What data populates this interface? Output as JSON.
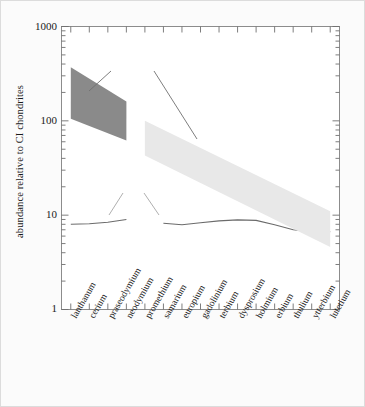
{
  "chart_data": {
    "type": "area",
    "title": "",
    "xlabel": "",
    "ylabel": "abundance relative to CI chondrites",
    "yscale": "log",
    "ylim": [
      1,
      1000
    ],
    "ytick_labels": [
      "1000",
      "100",
      "10",
      "1"
    ],
    "ytick_values": [
      1000,
      100,
      10,
      1
    ],
    "grid": false,
    "legend_position": "inline-annotations",
    "categories": [
      "lanthanum",
      "cerium",
      "praseodymium",
      "neodymium",
      "promethium",
      "samarium",
      "europium",
      "gadolinium",
      "terbium",
      "dysprosium",
      "holmium",
      "erbium",
      "thulium",
      "ytterbium",
      "lutetium"
    ],
    "series": [
      {
        "name": "Juvinas",
        "type": "line",
        "color": "#6b6b6b",
        "note": "gap at promethium (no data)",
        "points": [
          {
            "x": "lanthanum",
            "y": 8.0
          },
          {
            "x": "cerium",
            "y": 8.1
          },
          {
            "x": "praseodymium",
            "y": 8.4
          },
          {
            "x": "neodymium",
            "y": 9.0
          },
          {
            "x": "promethium",
            "y": null
          },
          {
            "x": "samarium",
            "y": 8.2
          },
          {
            "x": "europium",
            "y": 7.9
          },
          {
            "x": "gadolinium",
            "y": 8.3
          },
          {
            "x": "terbium",
            "y": 8.7
          },
          {
            "x": "dysprosium",
            "y": 8.9
          },
          {
            "x": "holmium",
            "y": 8.8
          },
          {
            "x": "erbium",
            "y": 7.9
          },
          {
            "x": "thulium",
            "y": 7.0
          },
          {
            "x": "ytterbium",
            "y": 6.7
          },
          {
            "x": "lutetium",
            "y": 6.7
          }
        ]
      },
      {
        "name": "basalts from the Earth (light REE band)",
        "type": "band",
        "color": "#e8e8e8",
        "upper": [
          {
            "x": "promethium",
            "y": 100
          },
          {
            "x": "lutetium",
            "y": 11
          }
        ],
        "lower": [
          {
            "x": "promethium",
            "y": 43
          },
          {
            "x": "lutetium",
            "y": 4.6
          }
        ]
      },
      {
        "name": "basalts from the Earth (dark LREE band)",
        "type": "band",
        "color": "#8a8a8a",
        "upper": [
          {
            "x": "lanthanum",
            "y": 370
          },
          {
            "x": "neodymium",
            "y": 160
          }
        ],
        "lower": [
          {
            "x": "lanthanum",
            "y": 105
          },
          {
            "x": "neodymium",
            "y": 62
          }
        ]
      }
    ],
    "annotations": [
      {
        "id": "basalts-label",
        "text": "basalts from the Earth",
        "color": "#1a1a1a"
      },
      {
        "id": "juvinas-label",
        "text": "Juvinas",
        "color": "#8f8f8f"
      }
    ]
  },
  "axis": {
    "y_title": "abundance relative to CI chondrites",
    "y_ticks": [
      "1000",
      "100",
      "10",
      "1"
    ]
  },
  "annotations": {
    "basalts": "basalts from the Earth",
    "juvinas": "Juvinas"
  }
}
